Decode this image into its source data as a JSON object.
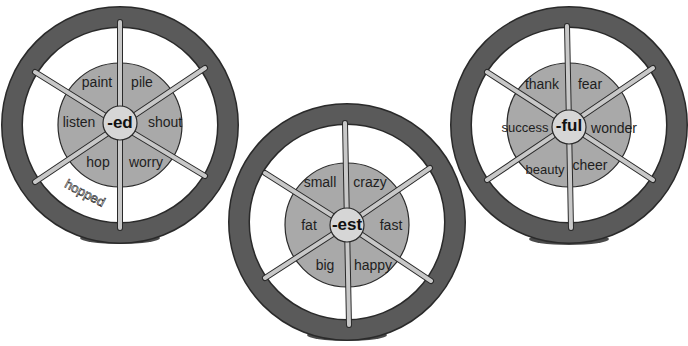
{
  "colors": {
    "rim": "#5a5a5a",
    "rim_outline": "#2a2a2a",
    "spoke": "#c8c8c8",
    "hub_ring": "#a9a9a9",
    "center": "#d6d6d6",
    "base": "#4a4a4a"
  },
  "wheels": [
    {
      "suffix": "-ed",
      "words": [
        "paint",
        "pile",
        "shout",
        "worry",
        "hop",
        "listen"
      ],
      "answer": "hopped"
    },
    {
      "suffix": "-est",
      "words": [
        "small",
        "crazy",
        "fast",
        "happy",
        "big",
        "fat"
      ]
    },
    {
      "suffix": "-ful",
      "words": [
        "thank",
        "fear",
        "wonder",
        "cheer",
        "beauty",
        "success"
      ]
    }
  ]
}
